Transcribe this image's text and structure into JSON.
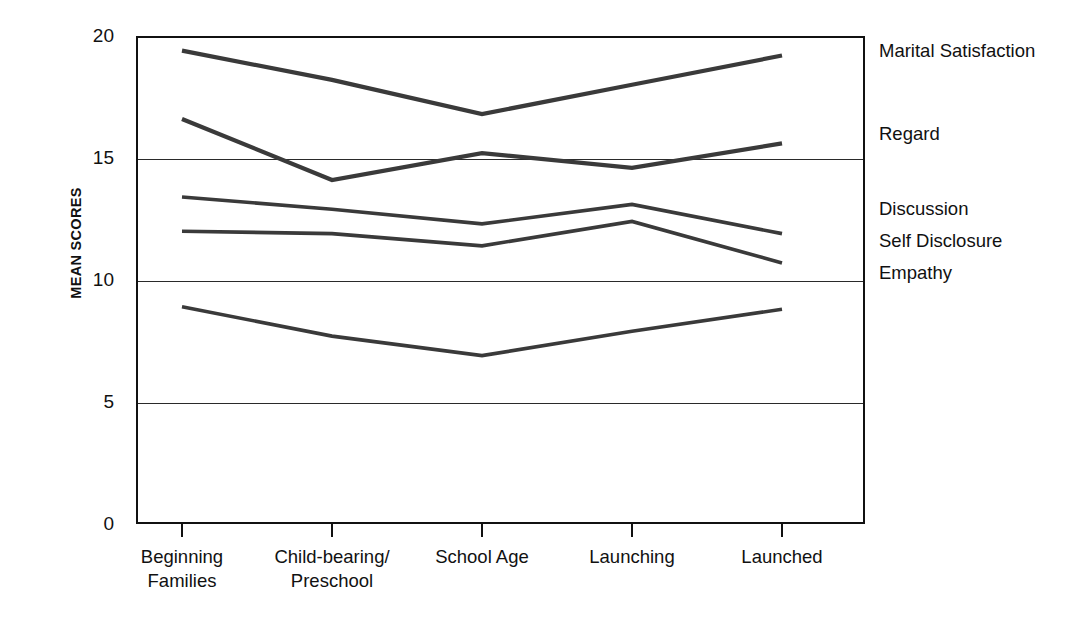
{
  "chart_data": {
    "type": "line",
    "title": "",
    "xlabel": "",
    "ylabel": "MEAN SCORES",
    "categories": [
      "Beginning\nFamilies",
      "Child-bearing/\nPreschool",
      "School Age",
      "Launching",
      "Launched"
    ],
    "ylim": [
      0,
      20
    ],
    "yticks": [
      0,
      5,
      10,
      15,
      20
    ],
    "ytick_labels": [
      "0",
      "5",
      "10",
      "15",
      "20"
    ],
    "grid": "horizontal",
    "legend_position": "right-of-axes-inline",
    "line_color": "#3a3a3a",
    "series": [
      {
        "name": "Marital Satisfaction",
        "values": [
          19.4,
          18.2,
          16.8,
          18.0,
          19.2
        ],
        "label_y": 19.4
      },
      {
        "name": "Regard",
        "values": [
          16.6,
          14.1,
          15.2,
          14.6,
          15.6
        ],
        "label_y": 16.0
      },
      {
        "name": "Discussion",
        "values": [
          13.4,
          12.9,
          12.3,
          13.1,
          11.9
        ],
        "label_y": 12.9
      },
      {
        "name": "Self Disclosure",
        "values": [
          12.0,
          11.9,
          11.4,
          12.4,
          10.7
        ],
        "label_y": 11.6
      },
      {
        "name": "Empathy",
        "values": [
          8.9,
          7.7,
          6.9,
          7.9,
          8.8
        ],
        "label_y": 10.3
      }
    ]
  }
}
